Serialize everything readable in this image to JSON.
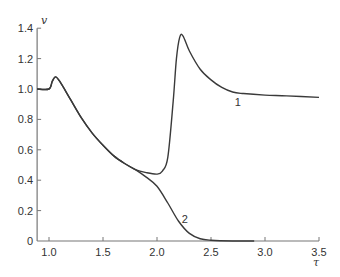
{
  "chart_data": {
    "type": "line",
    "title": "",
    "xlabel": "τ",
    "ylabel": "v",
    "xlim": [
      0.89,
      3.5
    ],
    "ylim": [
      0,
      1.4
    ],
    "grid": false,
    "legend": "none (inline curve labels)",
    "x_ticks": [
      "1.0",
      "1.5",
      "2.0",
      "2.5",
      "3.0",
      "3.5"
    ],
    "x_tick_values": [
      1.0,
      1.5,
      2.0,
      2.5,
      3.0,
      3.5
    ],
    "y_ticks": [
      "0",
      "0.2",
      "0.4",
      "0.6",
      "0.8",
      "1.0",
      "1.2",
      "1.4"
    ],
    "y_tick_values": [
      0,
      0.2,
      0.4,
      0.6,
      0.8,
      1.0,
      1.2,
      1.4
    ],
    "series": [
      {
        "name": "1",
        "label_pos": [
          2.72,
          0.89
        ],
        "x": [
          0.89,
          1.0,
          1.03,
          1.06,
          1.1,
          1.2,
          1.3,
          1.4,
          1.5,
          1.6,
          1.7,
          1.8,
          1.9,
          2.0,
          2.05,
          2.1,
          2.15,
          2.18,
          2.21,
          2.24,
          2.3,
          2.4,
          2.5,
          2.6,
          2.7,
          2.8,
          3.0,
          3.2,
          3.5
        ],
        "values": [
          1.0,
          1.0,
          1.05,
          1.08,
          1.05,
          0.93,
          0.81,
          0.71,
          0.63,
          0.56,
          0.51,
          0.47,
          0.45,
          0.44,
          0.46,
          0.55,
          0.92,
          1.2,
          1.34,
          1.35,
          1.25,
          1.13,
          1.06,
          1.01,
          0.98,
          0.97,
          0.96,
          0.955,
          0.945
        ]
      },
      {
        "name": "2",
        "label_pos": [
          2.23,
          0.12
        ],
        "x": [
          0.89,
          1.0,
          1.03,
          1.06,
          1.1,
          1.2,
          1.3,
          1.4,
          1.5,
          1.6,
          1.7,
          1.8,
          1.9,
          2.0,
          2.1,
          2.2,
          2.3,
          2.4,
          2.5,
          2.7,
          2.9
        ],
        "values": [
          1.0,
          1.0,
          1.05,
          1.08,
          1.05,
          0.93,
          0.81,
          0.71,
          0.63,
          0.56,
          0.51,
          0.47,
          0.42,
          0.36,
          0.25,
          0.13,
          0.05,
          0.015,
          0.005,
          0.0,
          0.0
        ]
      }
    ]
  },
  "colors": {
    "curve": "#3a3a3a",
    "axis": "#777777",
    "text": "#333333"
  }
}
